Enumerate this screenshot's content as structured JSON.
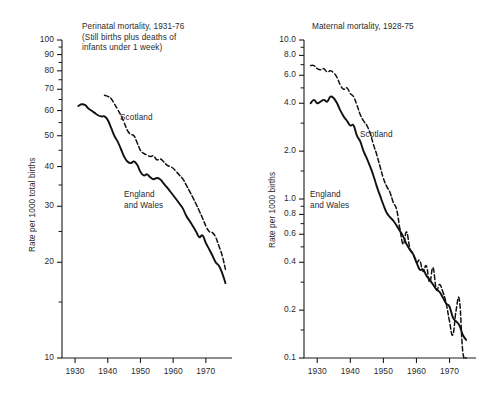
{
  "figure": {
    "background": "#ffffff",
    "line_color": "#111111",
    "text_color": "#2a2a2a"
  },
  "chart_data": [
    {
      "type": "line",
      "panel": "left",
      "title": "Perinatal mortality, 1931-76\n(Still births plus deaths of\ninfants under 1 week)",
      "title_lines": [
        "Perinatal mortality, 1931–76",
        "(Still births plus deaths of",
        "infants under 1 week)"
      ],
      "xlabel": "",
      "ylabel": "Rate per 1000 total births",
      "yscale": "log",
      "ylim": [
        10,
        100
      ],
      "xlim": [
        1926,
        1978
      ],
      "grid": false,
      "legend_position": "inline-annotation",
      "ytick_labels": [
        "100",
        "90",
        "80",
        "70",
        "60",
        "50",
        "40",
        "30",
        "20",
        "10"
      ],
      "ytick_values": [
        100,
        90,
        80,
        70,
        60,
        50,
        40,
        30,
        20,
        10
      ],
      "xtick_labels": [
        "1930",
        "1940",
        "1950",
        "1960",
        "1970"
      ],
      "xtick_values": [
        1930,
        1940,
        1950,
        1960,
        1970
      ],
      "series": [
        {
          "name": "Scotland",
          "style": "dashed",
          "annotation": "Scotland",
          "x": [
            1939,
            1940,
            1941,
            1942,
            1943,
            1944,
            1945,
            1946,
            1947,
            1948,
            1949,
            1950,
            1951,
            1952,
            1953,
            1954,
            1955,
            1956,
            1957,
            1958,
            1959,
            1960,
            1961,
            1962,
            1963,
            1964,
            1965,
            1966,
            1967,
            1968,
            1969,
            1970,
            1971,
            1972,
            1973,
            1974,
            1975,
            1976
          ],
          "y": [
            67.0,
            66.5,
            65.5,
            63.0,
            60.5,
            58.0,
            55.0,
            52.0,
            50.5,
            50.0,
            47.5,
            45.0,
            44.0,
            43.5,
            43.0,
            43.2,
            42.0,
            42.3,
            41.5,
            40.5,
            40.0,
            39.5,
            38.5,
            37.5,
            36.5,
            35.0,
            33.5,
            32.0,
            30.5,
            29.0,
            27.5,
            26.0,
            25.0,
            24.8,
            24.0,
            22.5,
            21.0,
            19.0
          ]
        },
        {
          "name": "England and Wales",
          "style": "solid",
          "annotation": "England\nand Wales",
          "annotation_lines": [
            "England",
            "and Wales"
          ],
          "x": [
            1931,
            1932,
            1933,
            1934,
            1935,
            1936,
            1937,
            1938,
            1939,
            1940,
            1941,
            1942,
            1943,
            1944,
            1945,
            1946,
            1947,
            1948,
            1949,
            1950,
            1951,
            1952,
            1953,
            1954,
            1955,
            1956,
            1957,
            1958,
            1959,
            1960,
            1961,
            1962,
            1963,
            1964,
            1965,
            1966,
            1967,
            1968,
            1969,
            1970,
            1971,
            1972,
            1973,
            1974,
            1975,
            1976
          ],
          "y": [
            62.0,
            62.8,
            62.5,
            61.0,
            60.0,
            59.0,
            58.0,
            57.5,
            57.5,
            56.0,
            53.0,
            50.0,
            48.0,
            45.5,
            43.0,
            41.5,
            41.0,
            41.5,
            40.5,
            38.5,
            37.5,
            37.8,
            37.0,
            36.5,
            36.8,
            36.5,
            35.5,
            34.5,
            33.5,
            32.5,
            31.5,
            30.5,
            29.5,
            28.0,
            27.0,
            26.0,
            25.0,
            24.0,
            24.3,
            23.0,
            22.0,
            21.0,
            20.0,
            19.5,
            18.5,
            17.2
          ]
        }
      ]
    },
    {
      "type": "line",
      "panel": "right",
      "title": "Maternal mortality, 1928-75",
      "title_lines": [
        "Maternal mortality, 1928–75"
      ],
      "xlabel": "",
      "ylabel": "Rate per 1000 births",
      "yscale": "log",
      "ylim": [
        0.1,
        10.0
      ],
      "xlim": [
        1926,
        1978
      ],
      "grid": false,
      "legend_position": "inline-annotation",
      "ytick_labels": [
        "10.0",
        "8.0",
        "6.0",
        "4.0",
        "2.0",
        "1.0",
        "0.8",
        "0.6",
        "0.4",
        "0.2",
        "0.1"
      ],
      "ytick_values": [
        10.0,
        8.0,
        6.0,
        4.0,
        2.0,
        1.0,
        0.8,
        0.6,
        0.4,
        0.2,
        0.1
      ],
      "xtick_labels": [
        "1930",
        "1940",
        "1950",
        "1960",
        "1970"
      ],
      "xtick_values": [
        1930,
        1940,
        1950,
        1960,
        1970
      ],
      "series": [
        {
          "name": "Scotland",
          "style": "dashed",
          "annotation": "Scotland",
          "x": [
            1928,
            1929,
            1930,
            1931,
            1932,
            1933,
            1934,
            1935,
            1936,
            1937,
            1938,
            1939,
            1940,
            1941,
            1942,
            1943,
            1944,
            1945,
            1946,
            1947,
            1948,
            1949,
            1950,
            1951,
            1952,
            1953,
            1954,
            1955,
            1956,
            1957,
            1958,
            1959,
            1960,
            1961,
            1962,
            1963,
            1964,
            1965,
            1966,
            1967,
            1968,
            1969,
            1970,
            1971,
            1972,
            1973,
            1974,
            1975
          ],
          "y": [
            6.9,
            6.9,
            6.6,
            6.5,
            6.6,
            6.3,
            6.4,
            6.2,
            5.8,
            5.2,
            4.9,
            5.0,
            4.6,
            4.4,
            3.9,
            3.4,
            3.1,
            2.9,
            2.6,
            2.2,
            1.9,
            1.6,
            1.35,
            1.2,
            1.1,
            0.95,
            0.86,
            0.65,
            0.52,
            0.62,
            0.49,
            0.45,
            0.4,
            0.41,
            0.35,
            0.38,
            0.3,
            0.37,
            0.27,
            0.29,
            0.26,
            0.22,
            0.17,
            0.14,
            0.2,
            0.23,
            0.11,
            0.1
          ]
        },
        {
          "name": "England and Wales",
          "style": "solid",
          "annotation": "England\nand Wales",
          "annotation_lines": [
            "England",
            "and Wales"
          ],
          "x": [
            1928,
            1929,
            1930,
            1931,
            1932,
            1933,
            1934,
            1935,
            1936,
            1937,
            1938,
            1939,
            1940,
            1941,
            1942,
            1943,
            1944,
            1945,
            1946,
            1947,
            1948,
            1949,
            1950,
            1951,
            1952,
            1953,
            1954,
            1955,
            1956,
            1957,
            1958,
            1959,
            1960,
            1961,
            1962,
            1963,
            1964,
            1965,
            1966,
            1967,
            1968,
            1969,
            1970,
            1971,
            1972,
            1973,
            1974,
            1975
          ],
          "y": [
            4.0,
            4.2,
            4.0,
            4.1,
            4.2,
            4.1,
            4.4,
            4.3,
            4.0,
            3.6,
            3.3,
            3.1,
            2.9,
            2.9,
            2.5,
            2.3,
            2.0,
            1.8,
            1.6,
            1.4,
            1.2,
            1.05,
            0.92,
            0.82,
            0.77,
            0.73,
            0.68,
            0.63,
            0.58,
            0.52,
            0.48,
            0.45,
            0.4,
            0.36,
            0.36,
            0.33,
            0.31,
            0.29,
            0.27,
            0.26,
            0.24,
            0.22,
            0.21,
            0.18,
            0.17,
            0.16,
            0.14,
            0.13
          ]
        }
      ]
    }
  ]
}
